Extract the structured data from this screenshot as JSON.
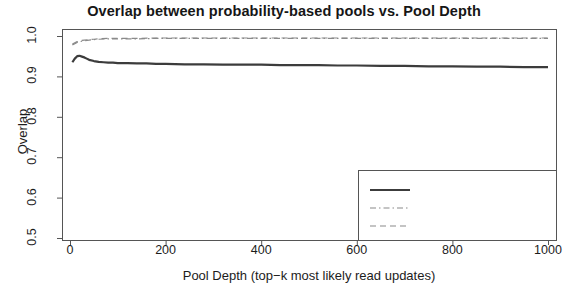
{
  "chart_data": {
    "type": "line",
    "title": "Overlap between probability-based pools vs. Pool Depth",
    "xlabel": "Pool Depth (top−k most likely read updates)",
    "ylabel": "Overlap",
    "xlim": [
      0,
      1000
    ],
    "ylim": [
      0.5,
      1.0
    ],
    "xticks": [
      0,
      200,
      400,
      600,
      800,
      1000
    ],
    "xtick_labels": [
      "0",
      "200",
      "400",
      "600",
      "800",
      "1000"
    ],
    "yticks": [
      0.5,
      0.6,
      0.7,
      0.8,
      0.9,
      1.0
    ],
    "ytick_labels": [
      "0.5",
      "0.6",
      "0.7",
      "0.8",
      "0.9",
      "1.0"
    ],
    "grid": false,
    "legend_position": "bottom-right",
    "legend_entries": [
      "Overlap",
      "Relevant overlap",
      "Non-relevant overlap"
    ],
    "series": [
      {
        "name": "Overlap",
        "style": "solid",
        "width": 2.2,
        "color": "#3c3c3c",
        "x": [
          5,
          10,
          15,
          20,
          25,
          30,
          35,
          40,
          50,
          60,
          70,
          80,
          90,
          100,
          120,
          140,
          160,
          180,
          200,
          240,
          280,
          320,
          360,
          400,
          440,
          480,
          520,
          560,
          600,
          650,
          700,
          750,
          800,
          850,
          900,
          950,
          1000
        ],
        "values": [
          0.935,
          0.944,
          0.95,
          0.951,
          0.949,
          0.947,
          0.944,
          0.941,
          0.938,
          0.936,
          0.935,
          0.934,
          0.934,
          0.933,
          0.933,
          0.932,
          0.932,
          0.931,
          0.931,
          0.93,
          0.93,
          0.929,
          0.929,
          0.929,
          0.928,
          0.928,
          0.928,
          0.927,
          0.927,
          0.926,
          0.926,
          0.925,
          0.925,
          0.924,
          0.924,
          0.923,
          0.923
        ]
      },
      {
        "name": "Relevant overlap",
        "style": "dashdot",
        "width": 1.2,
        "color": "#8a8a8a",
        "x": [
          5,
          10,
          15,
          20,
          25,
          30,
          40,
          50,
          60,
          80,
          100,
          140,
          180,
          220,
          260,
          300,
          360,
          420,
          480,
          540,
          600,
          680,
          760,
          840,
          920,
          1000
        ],
        "values": [
          0.978,
          0.981,
          0.984,
          0.986,
          0.987,
          0.988,
          0.99,
          0.991,
          0.992,
          0.993,
          0.993,
          0.993,
          0.994,
          0.994,
          0.994,
          0.994,
          0.994,
          0.994,
          0.994,
          0.994,
          0.994,
          0.994,
          0.994,
          0.994,
          0.994,
          0.994
        ]
      },
      {
        "name": "Non-relevant overlap",
        "style": "dashed",
        "width": 1.2,
        "color": "#8a8a8a",
        "x": [
          5,
          10,
          15,
          20,
          25,
          30,
          40,
          50,
          60,
          80,
          100,
          140,
          180,
          220,
          260,
          300,
          360,
          420,
          480,
          540,
          600,
          680,
          760,
          840,
          920,
          1000
        ],
        "values": [
          0.98,
          0.983,
          0.986,
          0.988,
          0.989,
          0.99,
          0.991,
          0.992,
          0.993,
          0.994,
          0.994,
          0.994,
          0.995,
          0.995,
          0.995,
          0.995,
          0.995,
          0.995,
          0.995,
          0.995,
          0.995,
          0.995,
          0.995,
          0.995,
          0.995,
          0.995
        ]
      }
    ]
  },
  "legend": {
    "items": [
      {
        "label": "Overlap"
      },
      {
        "label": "Relevant overlap"
      },
      {
        "label": "Non-relevant overlap"
      }
    ]
  },
  "colors": {
    "axis": "#555555",
    "series_primary": "#3c3c3c",
    "series_secondary": "#8a8a8a",
    "background": "#ffffff"
  }
}
